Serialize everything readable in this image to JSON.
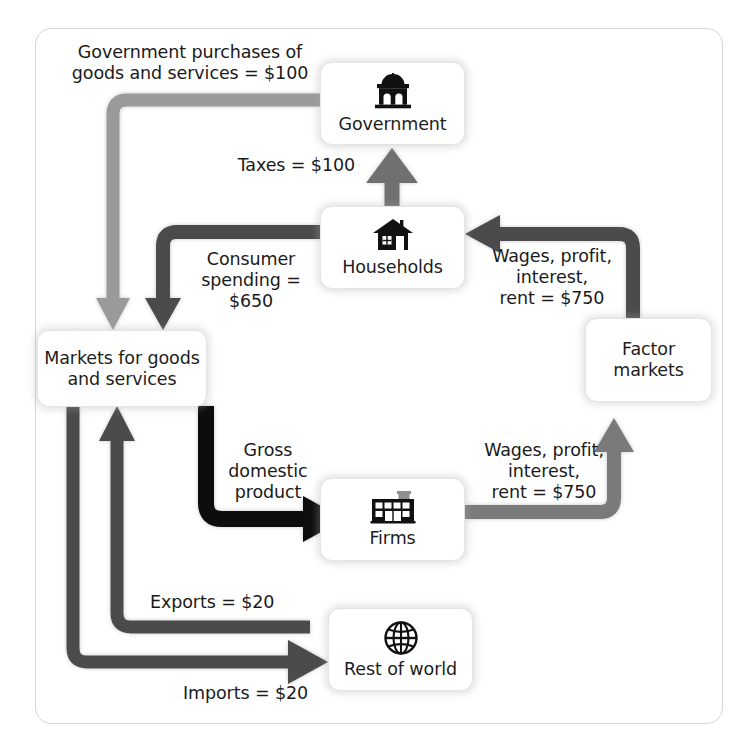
{
  "diagram": {
    "colors": {
      "light_gray_flow": "#9a9a9a",
      "mid_gray_flow": "#7a7a7a",
      "dark_gray_flow": "#4b4b4b",
      "black_flow": "#111111",
      "frame_border": "#d6d6d6",
      "node_border": "#e3e3e3",
      "text": "#1a1a1a"
    }
  },
  "nodes": [
    {
      "id": "government",
      "label": "Government",
      "icon": "capitol-building-icon"
    },
    {
      "id": "households",
      "label": "Households",
      "icon": "house-icon"
    },
    {
      "id": "markets",
      "label": "Markets for goods\nand services",
      "icon": "none"
    },
    {
      "id": "factor_markets",
      "label": "Factor\nmarkets",
      "icon": "none"
    },
    {
      "id": "firms",
      "label": "Firms",
      "icon": "factory-icon"
    },
    {
      "id": "rest_of_world",
      "label": "Rest of world",
      "icon": "globe-icon"
    }
  ],
  "flows": [
    {
      "id": "government_purchases",
      "label": "Government purchases of\ngoods and services = $100",
      "from": "government",
      "to": "markets",
      "amount": 100,
      "color": "light_gray_flow"
    },
    {
      "id": "taxes",
      "label": "Taxes = $100",
      "from": "households",
      "to": "government",
      "amount": 100,
      "color": "mid_gray_flow"
    },
    {
      "id": "consumer_spending",
      "label": "Consumer\nspending = $650",
      "from": "households",
      "to": "markets",
      "amount": 650,
      "color": "dark_gray_flow"
    },
    {
      "id": "wages_to_households",
      "label": "Wages, profit,\ninterest,\nrent = $750",
      "from": "factor_markets",
      "to": "households",
      "amount": 750,
      "color": "dark_gray_flow"
    },
    {
      "id": "wages_from_firms",
      "label": "Wages, profit,\ninterest,\nrent = $750",
      "from": "firms",
      "to": "factor_markets",
      "amount": 750,
      "color": "mid_gray_flow"
    },
    {
      "id": "gross_domestic_product",
      "label": "Gross\ndomestic\nproduct",
      "from": "markets",
      "to": "firms",
      "amount": null,
      "color": "black_flow"
    },
    {
      "id": "exports",
      "label": "Exports = $20",
      "from": "rest_of_world",
      "to": "markets",
      "amount": 20,
      "color": "dark_gray_flow"
    },
    {
      "id": "imports",
      "label": "Imports = $20",
      "from": "markets",
      "to": "rest_of_world",
      "amount": 20,
      "color": "dark_gray_flow"
    }
  ]
}
